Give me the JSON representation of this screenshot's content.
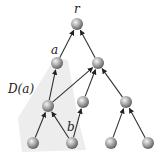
{
  "diagram": {
    "region_label": "D(a)",
    "region_color": "#ececec",
    "node_color": "#9a9a9a",
    "edge_color": "#333333",
    "nodes": [
      {
        "id": "r",
        "label": "r",
        "x": 77,
        "y": 24
      },
      {
        "id": "a",
        "label": "a",
        "x": 57,
        "y": 63
      },
      {
        "id": "n2",
        "label": "",
        "x": 98,
        "y": 63
      },
      {
        "id": "n3",
        "label": "",
        "x": 48,
        "y": 106
      },
      {
        "id": "n4",
        "label": "",
        "x": 83,
        "y": 102
      },
      {
        "id": "n5",
        "label": "",
        "x": 126,
        "y": 102
      },
      {
        "id": "l1",
        "label": "",
        "x": 33,
        "y": 143
      },
      {
        "id": "b",
        "label": "b",
        "x": 72,
        "y": 143
      },
      {
        "id": "l3",
        "label": "",
        "x": 111,
        "y": 143
      },
      {
        "id": "l4",
        "label": "",
        "x": 148,
        "y": 143
      }
    ],
    "edges": [
      [
        "a",
        "r"
      ],
      [
        "n2",
        "r"
      ],
      [
        "n3",
        "a"
      ],
      [
        "n3",
        "n2"
      ],
      [
        "n4",
        "n2"
      ],
      [
        "n5",
        "n2"
      ],
      [
        "l1",
        "n3"
      ],
      [
        "b",
        "n3"
      ],
      [
        "b",
        "n4"
      ],
      [
        "l3",
        "n5"
      ],
      [
        "l4",
        "n5"
      ]
    ]
  }
}
